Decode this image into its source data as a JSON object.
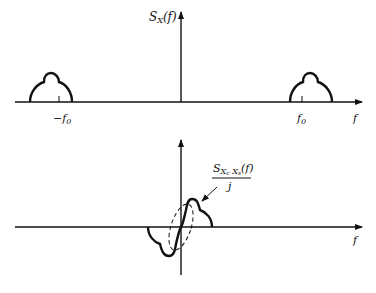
{
  "top_plot": {
    "y_label_main": "S",
    "y_label_sub": "X",
    "y_label_arg": "(f)",
    "x_axis_label": "f",
    "tick_neg_label": "−f",
    "tick_neg_sub": "0",
    "tick_pos_label": "f",
    "tick_pos_sub": "0"
  },
  "bottom_plot": {
    "x_axis_label": "f",
    "annotation_numerator_main": "S",
    "annotation_numerator_sub": "X",
    "annotation_numerator_sub2": "c",
    "annotation_numerator_mid": " X",
    "annotation_numerator_sub3": "s",
    "annotation_numerator_arg": "(f)",
    "annotation_denominator": "j"
  },
  "colors": {
    "stroke": "#111111",
    "background": "#ffffff"
  }
}
